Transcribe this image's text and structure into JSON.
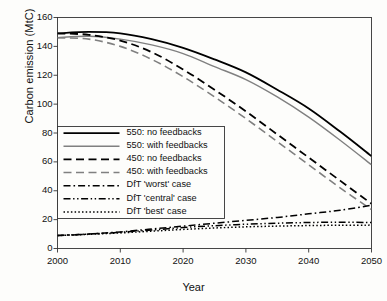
{
  "chart_data": {
    "type": "line",
    "title": "",
    "xlabel": "Year",
    "ylabel": "Carbon emission (MtC)",
    "xlim": [
      2000,
      2050
    ],
    "ylim": [
      0,
      160
    ],
    "xticks": [
      "2000",
      "2010",
      "2020",
      "2030",
      "2040",
      "2050"
    ],
    "yticks": [
      "0",
      "20",
      "40",
      "60",
      "80",
      "100",
      "120",
      "140",
      "160"
    ],
    "grid": false,
    "legend_position": "center-left inside axes",
    "x": [
      2000,
      2005,
      2010,
      2015,
      2020,
      2025,
      2030,
      2035,
      2040,
      2045,
      2050
    ],
    "series": [
      {
        "name": "550: no feedbacks",
        "color": "#000000",
        "style": "solid",
        "width": 1.8,
        "values": [
          149,
          150,
          149,
          145,
          139,
          131,
          122,
          110,
          97,
          81,
          64
        ]
      },
      {
        "name": "550: with feedbacks",
        "color": "#808080",
        "style": "solid",
        "width": 1.4,
        "values": [
          146,
          147,
          145,
          141,
          135,
          126,
          117,
          105,
          91,
          75,
          58
        ]
      },
      {
        "name": "450: no feedbacks",
        "color": "#000000",
        "style": "dashed",
        "width": 1.8,
        "values": [
          149,
          148,
          144,
          136,
          124,
          110,
          95,
          79,
          63,
          47,
          31
        ]
      },
      {
        "name": "450: with feedbacks",
        "color": "#808080",
        "style": "dashed",
        "width": 1.6,
        "values": [
          146,
          145,
          140,
          131,
          119,
          105,
          90,
          74,
          58,
          42,
          27
        ]
      },
      {
        "name": "DfT 'worst' case",
        "color": "#000000",
        "style": "dashdot",
        "width": 1.5,
        "values": [
          9,
          10,
          11.5,
          13.5,
          15.5,
          17.5,
          19.5,
          21.5,
          24,
          26.5,
          30
        ]
      },
      {
        "name": "DfT 'central' case",
        "color": "#000000",
        "style": "dashdotdot",
        "width": 1.5,
        "values": [
          9,
          10,
          11.2,
          12.8,
          14.5,
          15.8,
          16.8,
          17.5,
          18,
          18.2,
          18
        ]
      },
      {
        "name": "DfT 'best' case",
        "color": "#000000",
        "style": "dotted",
        "width": 1.5,
        "values": [
          9,
          9.8,
          10.8,
          12,
          13.2,
          14.2,
          15,
          15.5,
          15.9,
          16.1,
          16.2
        ]
      }
    ]
  },
  "legend": {
    "items": [
      {
        "label": "550: no feedbacks"
      },
      {
        "label": "550: with feedbacks"
      },
      {
        "label": "450: no feedbacks"
      },
      {
        "label": "450: with feedbacks"
      },
      {
        "label": "DfT 'worst' case"
      },
      {
        "label": "DfT 'central' case"
      },
      {
        "label": "DfT  'best' case"
      }
    ]
  }
}
